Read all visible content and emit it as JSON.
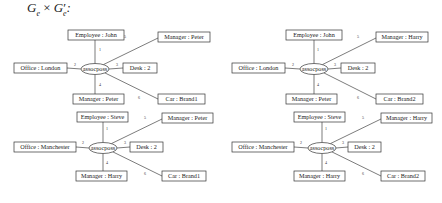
{
  "title": {
    "base1": "G",
    "sub1": "e",
    "times": " × ",
    "base2": "G",
    "prime": "′",
    "sub2": "e",
    "colon": ":"
  },
  "graphs": [
    {
      "id": "top-left",
      "center": "assocposs",
      "nodes": [
        "Employee : John",
        "Office : London",
        "Desk : 2",
        "Manager : Peter",
        "Manager : Peter",
        "Car : Brand1"
      ],
      "edge_labels": [
        "1",
        "2",
        "3",
        "4",
        "5",
        "6"
      ]
    },
    {
      "id": "top-right",
      "center": "assocposs",
      "nodes": [
        "Employee : John",
        "Office : London",
        "Desk : 2",
        "Manager : Peter",
        "Manager : Harry",
        "Car : Brand2"
      ],
      "edge_labels": [
        "1",
        "2",
        "3",
        "4",
        "5",
        "6"
      ]
    },
    {
      "id": "bottom-left",
      "center": "assocposs",
      "nodes": [
        "Employee : Steve",
        "Office : Manchester",
        "Desk : 2",
        "Manager : Harry",
        "Manager : Peter",
        "Car : Brand1"
      ],
      "edge_labels": [
        "1",
        "2",
        "3",
        "4",
        "5",
        "6"
      ]
    },
    {
      "id": "bottom-right",
      "center": "assocposs",
      "nodes": [
        "Employee : Steve",
        "Office : Manchester",
        "Desk : 2",
        "Manager : Harry",
        "Manager : Harry",
        "Car : Brand2"
      ],
      "edge_labels": [
        "1",
        "2",
        "3",
        "4",
        "5",
        "6"
      ]
    }
  ]
}
